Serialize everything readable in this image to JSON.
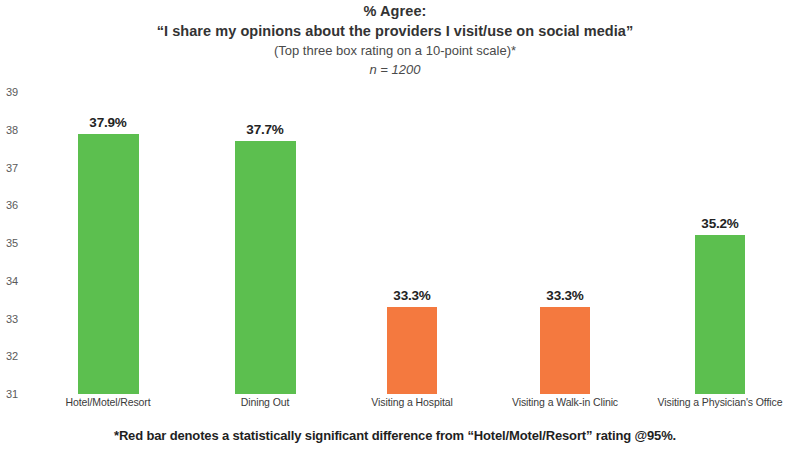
{
  "title": {
    "line1": "% Agree:",
    "line2": "“I share my opinions about the providers I visit/use on social media”",
    "line3": "(Top three box rating on a 10-point scale)*",
    "line4": "n = 1200"
  },
  "footnote": "*Red bar denotes a statistically significant difference from “Hotel/Motel/Resort” rating @95%.",
  "colors": {
    "green": "#5cbf4f",
    "orange": "#f4793f",
    "background": "#ffffff",
    "tick_text": "#5a5a5a",
    "label_text": "#232323"
  },
  "chart_data": {
    "type": "bar",
    "title": "% Agree: “I share my opinions about the providers I visit/use on social media”",
    "subtitle": "(Top three box rating on a 10-point scale)*",
    "sample_size": "n = 1200",
    "xlabel": "",
    "ylabel": "",
    "ylim": [
      31,
      39
    ],
    "ytick_step": 1,
    "yticks": [
      31,
      32,
      33,
      34,
      35,
      36,
      37,
      38,
      39
    ],
    "ytick_labels": [
      "31",
      "32",
      "33",
      "34",
      "35",
      "36",
      "37",
      "38",
      "39"
    ],
    "grid": false,
    "legend": "none",
    "categories": [
      "Hotel/Motel/Resort",
      "Dining Out",
      "Visiting a Hospital",
      "Visiting a Walk-in Clinic",
      "Visiting a Physician's Office"
    ],
    "values": [
      37.9,
      37.7,
      33.3,
      33.3,
      35.2
    ],
    "value_labels": [
      "37.9%",
      "37.7%",
      "33.3%",
      "33.3%",
      "35.2%"
    ],
    "bar_colors": [
      "#5cbf4f",
      "#5cbf4f",
      "#f4793f",
      "#f4793f",
      "#5cbf4f"
    ],
    "bar_color_names": [
      "green",
      "green",
      "orange",
      "orange",
      "green"
    ],
    "annotation": "*Red bar denotes a statistically significant difference from “Hotel/Motel/Resort” rating @95%."
  }
}
